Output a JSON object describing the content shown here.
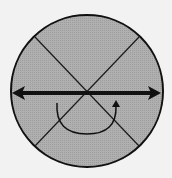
{
  "diagram": {
    "title": "Circle with crossed diagonals, horizontal double arrow and rotation arrow",
    "colors": {
      "background": "#f2f2f2",
      "circle_fill": "#a9a9a9",
      "stroke": "#111111"
    },
    "circle": {
      "cx": 87,
      "cy": 91,
      "r": 77
    },
    "diagonals": [
      {
        "x1": 35,
        "y1": 37,
        "x2": 139,
        "y2": 146
      },
      {
        "x1": 139,
        "y1": 37,
        "x2": 35,
        "y2": 146
      }
    ],
    "horizontal_arrow": {
      "x1": 12,
      "y1": 93,
      "x2": 161,
      "y2": 93,
      "heads": "both"
    },
    "rotation_arrow": {
      "direction": "counterclockwise-under",
      "start": [
        57,
        103
      ],
      "end": [
        116,
        101
      ]
    }
  }
}
